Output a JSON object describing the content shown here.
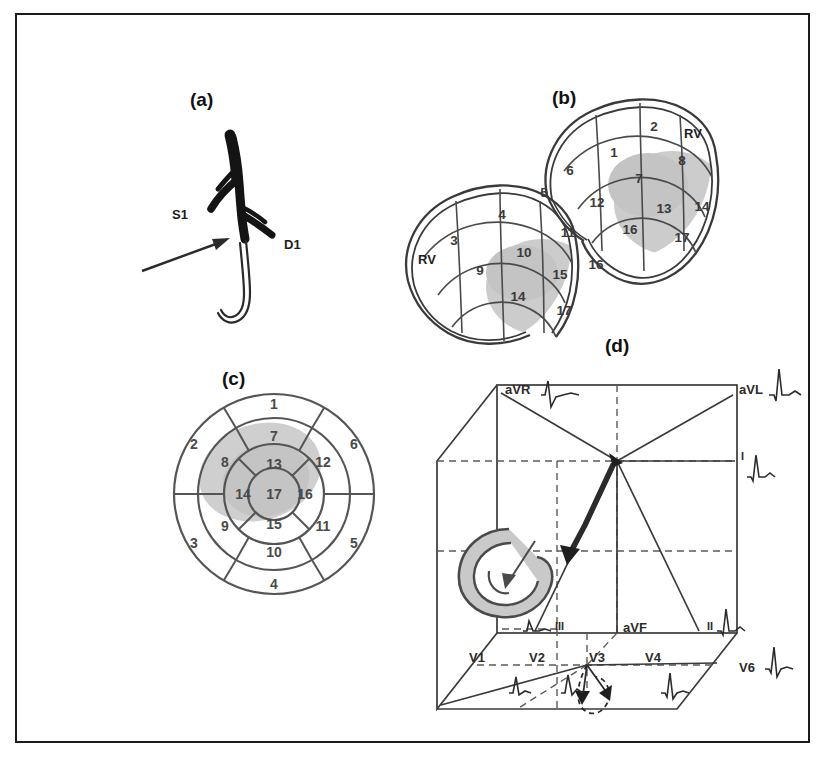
{
  "figure": {
    "panels": [
      {
        "id": "a",
        "label": "(a)",
        "caption_kind": "coronary-angiogram-schematic",
        "annotations": [
          {
            "text": "S1",
            "x": 78,
            "y": 140
          },
          {
            "text": "D1",
            "x": 175,
            "y": 170
          }
        ],
        "marker": "arrow-pointing-to-lesion"
      },
      {
        "id": "b",
        "label": "(b)",
        "caption_kind": "three-dimensional-left-ventricle-segments",
        "views": [
          {
            "name": "upper-right-view",
            "rv_label": "RV",
            "segments": [
              {
                "n": "1",
                "x": 222,
                "y": 78
              },
              {
                "n": "2",
                "x": 262,
                "y": 52
              },
              {
                "n": "6",
                "x": 178,
                "y": 96
              },
              {
                "n": "7",
                "x": 247,
                "y": 104
              },
              {
                "n": "8",
                "x": 290,
                "y": 86
              },
              {
                "n": "12",
                "x": 205,
                "y": 128
              },
              {
                "n": "13",
                "x": 272,
                "y": 134
              },
              {
                "n": "14",
                "x": 310,
                "y": 132
              },
              {
                "n": "16",
                "x": 238,
                "y": 155
              },
              {
                "n": "17",
                "x": 290,
                "y": 163
              }
            ]
          },
          {
            "name": "lower-left-view",
            "rv_label": "RV",
            "segments": [
              {
                "n": "3",
                "x": 62,
                "y": 166
              },
              {
                "n": "4",
                "x": 110,
                "y": 140
              },
              {
                "n": "5",
                "x": 152,
                "y": 118
              },
              {
                "n": "9",
                "x": 88,
                "y": 196
              },
              {
                "n": "10",
                "x": 132,
                "y": 178
              },
              {
                "n": "11",
                "x": 176,
                "y": 158
              },
              {
                "n": "14",
                "x": 126,
                "y": 222
              },
              {
                "n": "15",
                "x": 168,
                "y": 200
              },
              {
                "n": "16",
                "x": 204,
                "y": 190
              },
              {
                "n": "17",
                "x": 172,
                "y": 236
              }
            ]
          }
        ]
      },
      {
        "id": "c",
        "label": "(c)",
        "caption_kind": "seventeen-segment-bullseye-polar-plot",
        "rings": {
          "basal": [
            "1",
            "2",
            "3",
            "4",
            "5",
            "6"
          ],
          "mid": [
            "7",
            "8",
            "9",
            "10",
            "11",
            "12"
          ],
          "apical": [
            "13",
            "14",
            "15",
            "16"
          ],
          "apex": [
            "17"
          ]
        },
        "segment_positions": [
          {
            "n": "1",
            "x": 132,
            "y": 44
          },
          {
            "n": "2",
            "x": 52,
            "y": 84
          },
          {
            "n": "3",
            "x": 52,
            "y": 183
          },
          {
            "n": "4",
            "x": 132,
            "y": 224
          },
          {
            "n": "5",
            "x": 212,
            "y": 183
          },
          {
            "n": "6",
            "x": 212,
            "y": 84
          },
          {
            "n": "7",
            "x": 132,
            "y": 76
          },
          {
            "n": "8",
            "x": 83,
            "y": 102
          },
          {
            "n": "9",
            "x": 83,
            "y": 166
          },
          {
            "n": "10",
            "x": 132,
            "y": 192
          },
          {
            "n": "11",
            "x": 181,
            "y": 166
          },
          {
            "n": "12",
            "x": 181,
            "y": 102
          },
          {
            "n": "13",
            "x": 132,
            "y": 104
          },
          {
            "n": "14",
            "x": 101,
            "y": 134
          },
          {
            "n": "15",
            "x": 132,
            "y": 164
          },
          {
            "n": "16",
            "x": 163,
            "y": 134
          },
          {
            "n": "17",
            "x": 132,
            "y": 134
          }
        ],
        "shaded_segments": [
          "7",
          "8",
          "13",
          "14",
          "17"
        ]
      },
      {
        "id": "d",
        "label": "(d)",
        "caption_kind": "three-dimensional-ecg-lead-vector-cube",
        "leads": [
          {
            "name": "aVR",
            "x": 88,
            "y": 146,
            "waveform": "rS"
          },
          {
            "name": "aVL",
            "x": 318,
            "y": 146,
            "waveform": "qR"
          },
          {
            "name": "I",
            "x": 322,
            "y": 218,
            "waveform": "qR"
          },
          {
            "name": "II",
            "x": 288,
            "y": 297,
            "waveform": "qR"
          },
          {
            "name": "III",
            "x": 152,
            "y": 300,
            "waveform": "qR"
          },
          {
            "name": "aVF",
            "x": 225,
            "y": 297,
            "waveform": "none"
          },
          {
            "name": "V6",
            "x": 318,
            "y": 400,
            "waveform": "qRs"
          },
          {
            "name": "V1",
            "x": 95,
            "y": 330,
            "waveform": "rS"
          },
          {
            "name": "V2",
            "x": 148,
            "y": 330,
            "waveform": "rS"
          },
          {
            "name": "V3",
            "x": 198,
            "y": 330,
            "waveform": "none"
          },
          {
            "name": "V4",
            "x": 248,
            "y": 330,
            "waveform": "qRs"
          }
        ],
        "features": [
          "vcg-loop-on-left-face",
          "vector-convergence-point",
          "bold-initial-vector-arrow",
          "terminal-loop-on-bottom-face"
        ]
      }
    ]
  },
  "colors": {
    "frame": "#1c1c1c",
    "ink": "#2b2b2b",
    "ink_light": "#555555",
    "shade_gray": "#c9c9c9",
    "shade_gray_dark": "#b3b3b3",
    "vessel_dark": "#141414",
    "background": "#ffffff"
  }
}
